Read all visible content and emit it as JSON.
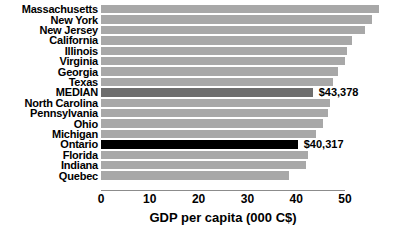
{
  "chart_data": {
    "type": "bar",
    "orientation": "horizontal",
    "title": "",
    "xlabel": "GDP per capita (000 C$)",
    "ylabel": "",
    "xlim": [
      0,
      58
    ],
    "xticks": [
      0,
      10,
      20,
      30,
      40,
      50
    ],
    "xtick_labels": [
      "0",
      "10",
      "20",
      "30",
      "40",
      "50"
    ],
    "grid": false,
    "legend": "none",
    "colors": {
      "bar": "#a8a8a8",
      "median_bar": "#6e6e6e",
      "highlight_bar": "#000000",
      "axis": "#8c8c8c",
      "text": "#000000"
    },
    "categories": [
      "Massachusetts",
      "New York",
      "New Jersey",
      "California",
      "Illinois",
      "Virginia",
      "Georgia",
      "Texas",
      "MEDIAN",
      "North Carolina",
      "Pennsylvania",
      "Ohio",
      "Michigan",
      "Ontario",
      "Florida",
      "Indiana",
      "Quebec"
    ],
    "values": [
      57.0,
      55.5,
      54.0,
      51.5,
      50.5,
      50.0,
      48.5,
      47.5,
      43.378,
      47.0,
      46.5,
      45.5,
      44.0,
      40.317,
      42.5,
      42.0,
      38.5
    ],
    "bars": [
      {
        "label": "Massachusetts",
        "value": 57.0,
        "style": "bar",
        "data_label": ""
      },
      {
        "label": "New York",
        "value": 55.5,
        "style": "bar",
        "data_label": ""
      },
      {
        "label": "New Jersey",
        "value": 54.0,
        "style": "bar",
        "data_label": ""
      },
      {
        "label": "California",
        "value": 51.5,
        "style": "bar",
        "data_label": ""
      },
      {
        "label": "Illinois",
        "value": 50.5,
        "style": "bar",
        "data_label": ""
      },
      {
        "label": "Virginia",
        "value": 50.0,
        "style": "bar",
        "data_label": ""
      },
      {
        "label": "Georgia",
        "value": 48.5,
        "style": "bar",
        "data_label": ""
      },
      {
        "label": "Texas",
        "value": 47.5,
        "style": "bar",
        "data_label": ""
      },
      {
        "label": "MEDIAN",
        "value": 43.378,
        "style": "median",
        "data_label": "$43,378"
      },
      {
        "label": "North Carolina",
        "value": 47.0,
        "style": "bar",
        "data_label": ""
      },
      {
        "label": "Pennsylvania",
        "value": 46.5,
        "style": "bar",
        "data_label": ""
      },
      {
        "label": "Ohio",
        "value": 45.5,
        "style": "bar",
        "data_label": ""
      },
      {
        "label": "Michigan",
        "value": 44.0,
        "style": "bar",
        "data_label": ""
      },
      {
        "label": "Ontario",
        "value": 40.317,
        "style": "highlight",
        "data_label": "$40,317"
      },
      {
        "label": "Florida",
        "value": 42.5,
        "style": "bar",
        "data_label": ""
      },
      {
        "label": "Indiana",
        "value": 42.0,
        "style": "bar",
        "data_label": ""
      },
      {
        "label": "Quebec",
        "value": 38.5,
        "style": "bar",
        "data_label": ""
      }
    ]
  },
  "caption": ""
}
